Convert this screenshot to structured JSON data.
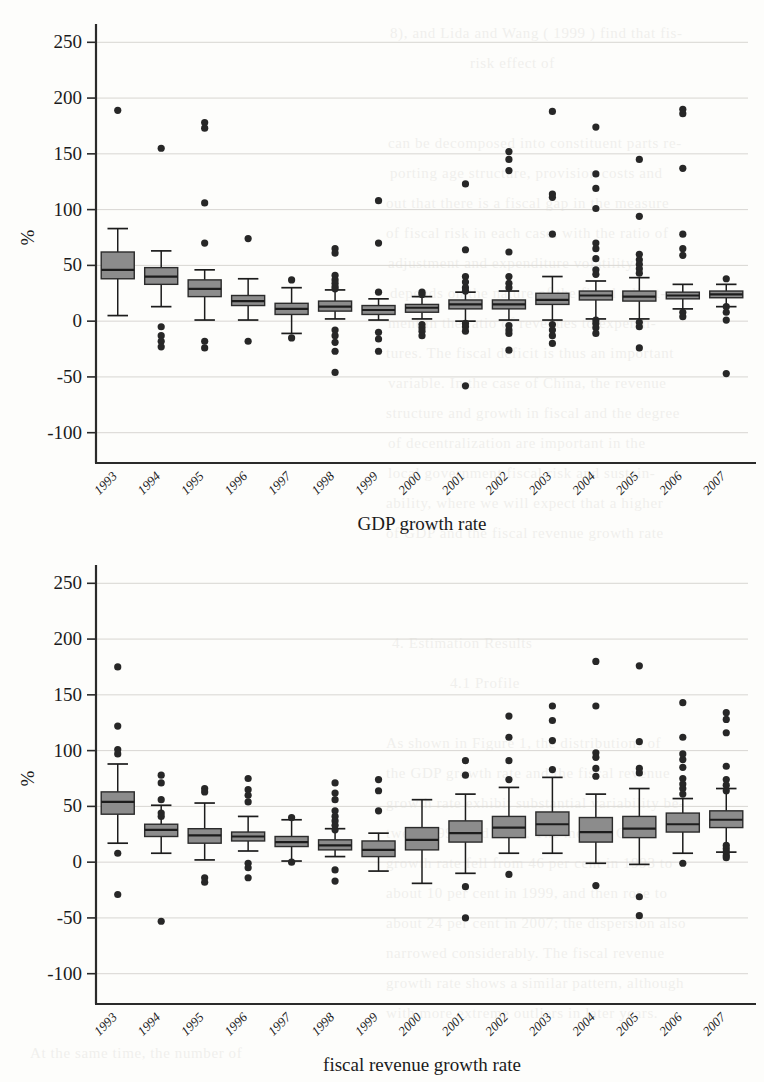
{
  "page": {
    "background_color": "#fdfdfb",
    "ink_color": "#1b1b1b",
    "box_fill_color": "#8c8c8c",
    "gridline_color": "#d8d6d2"
  },
  "bleed_through_text": [
    {
      "text": "8), and  Lida  and  Wang ( 1999 ) find  that  fis-",
      "x": 390,
      "y": 18
    },
    {
      "text": "risk  effect  of",
      "x": 470,
      "y": 48
    },
    {
      "text": "can  be  decomposed  into  constituent  parts  re-",
      "x": 388,
      "y": 128
    },
    {
      "text": "porting  age  structure,  provision  costs  and",
      "x": 390,
      "y": 158
    },
    {
      "text": "out  that  there  is  a  fiscal  gap  in  the  measure",
      "x": 386,
      "y": 188
    },
    {
      "text": "of  fiscal  risk  in  each  case,  with  the  ratio  of",
      "x": 386,
      "y": 218
    },
    {
      "text": "adjustment  and  expenditure  volatility",
      "x": 388,
      "y": 248
    },
    {
      "text": "depends  on  the  nature  of  the  fiscal  adjust-",
      "x": 390,
      "y": 278
    },
    {
      "text": "ment  in  the  ratio  of  revenues  to  expendi-",
      "x": 388,
      "y": 308
    },
    {
      "text": "tures.  The  fiscal  deficit  is  thus  an  important",
      "x": 386,
      "y": 338
    },
    {
      "text": "variable.  In  the  case  of  China,  the  revenue",
      "x": 388,
      "y": 368
    },
    {
      "text": "structure  and  growth  in  fiscal  and  the  degree",
      "x": 386,
      "y": 398
    },
    {
      "text": "of  decentralization  are  important  in  the",
      "x": 388,
      "y": 428
    },
    {
      "text": "local  government  fiscal  risk  and  sustain-",
      "x": 388,
      "y": 458
    },
    {
      "text": "ability,  where  we  will  expect  that  a  higher",
      "x": 386,
      "y": 488
    },
    {
      "text": "of  GDP  and  the  fiscal  revenue  growth  rate",
      "x": 386,
      "y": 518
    },
    {
      "text": "4. Estimation  Results",
      "x": 392,
      "y": 628
    },
    {
      "text": "4.1  Profile",
      "x": 450,
      "y": 668
    },
    {
      "text": "As  shown  in  Figure  1,  the  distributions  of",
      "x": 386,
      "y": 728
    },
    {
      "text": "the  GDP  growth  rate  and  the  fiscal  revenue",
      "x": 386,
      "y": 758
    },
    {
      "text": "growth  rate  exhibit  substantial  variability  be-",
      "x": 386,
      "y": 788
    },
    {
      "text": "tween  1993  and  2007.  The  median  GDP",
      "x": 386,
      "y": 818
    },
    {
      "text": "growth  rate  fell  from  46  per  cent  in  1993  to",
      "x": 386,
      "y": 848
    },
    {
      "text": "about  10  per  cent  in  1999,  and  then  rose  to",
      "x": 386,
      "y": 878
    },
    {
      "text": "about  24  per  cent  in  2007;  the  dispersion  also",
      "x": 386,
      "y": 908
    },
    {
      "text": "narrowed  considerably.  The  fiscal  revenue",
      "x": 386,
      "y": 938
    },
    {
      "text": "growth  rate  shows  a  similar  pattern,  although",
      "x": 386,
      "y": 968
    },
    {
      "text": "with  more  extreme  outliers  in  later  years.",
      "x": 386,
      "y": 998
    },
    {
      "text": "At  the  same  time,  the  number  of",
      "x": 30,
      "y": 1038
    }
  ],
  "chart_data": [
    {
      "id": "gdp-growth",
      "type": "box",
      "title": "GDP growth rate",
      "xlabel": "GDP growth rate",
      "ylabel": "%",
      "ylim": [
        -120,
        270
      ],
      "yticks": [
        250,
        200,
        150,
        100,
        50,
        0,
        -50,
        -100
      ],
      "ytick_labels": [
        "250",
        "200",
        "150",
        "100",
        "50",
        "0",
        "-50",
        "-100"
      ],
      "grid": "horizontal",
      "categories": [
        "1993",
        "1994",
        "1995",
        "1996",
        "1997",
        "1998",
        "1999",
        "2000",
        "2001",
        "2002",
        "2003",
        "2004",
        "2005",
        "2006",
        "2007"
      ],
      "boxes": [
        {
          "category": "1993",
          "lower_whisker": 5,
          "q1": 38,
          "median": 46,
          "q3": 62,
          "upper_whisker": 83,
          "outliers": [
            189
          ]
        },
        {
          "category": "1994",
          "lower_whisker": 13,
          "q1": 33,
          "median": 40,
          "q3": 48,
          "upper_whisker": 63,
          "outliers": [
            155,
            -5,
            -13,
            -18,
            -23
          ]
        },
        {
          "category": "1995",
          "lower_whisker": 1,
          "q1": 22,
          "median": 29,
          "q3": 37,
          "upper_whisker": 46,
          "outliers": [
            178,
            173,
            106,
            70,
            -18,
            -24
          ]
        },
        {
          "category": "1996",
          "lower_whisker": 1,
          "q1": 14,
          "median": 18,
          "q3": 23,
          "upper_whisker": 38,
          "outliers": [
            74,
            -18
          ]
        },
        {
          "category": "1997",
          "lower_whisker": -11,
          "q1": 6,
          "median": 11,
          "q3": 16,
          "upper_whisker": 30,
          "outliers": [
            37,
            -15
          ]
        },
        {
          "category": "1998",
          "lower_whisker": 2,
          "q1": 9,
          "median": 13,
          "q3": 18,
          "upper_whisker": 28,
          "outliers": [
            65,
            61,
            41,
            37,
            34,
            31,
            29,
            -8,
            -13,
            -19,
            -27,
            -46
          ]
        },
        {
          "category": "1999",
          "lower_whisker": 1,
          "q1": 6,
          "median": 10,
          "q3": 14,
          "upper_whisker": 20,
          "outliers": [
            108,
            70,
            26,
            -10,
            -16,
            -27
          ]
        },
        {
          "category": "2000",
          "lower_whisker": 2,
          "q1": 8,
          "median": 12,
          "q3": 15,
          "upper_whisker": 22,
          "outliers": [
            26,
            24,
            -3,
            -6,
            -9,
            -13
          ]
        },
        {
          "category": "2001",
          "lower_whisker": 0,
          "q1": 11,
          "median": 15,
          "q3": 19,
          "upper_whisker": 26,
          "outliers": [
            123,
            64,
            40,
            35,
            30,
            27,
            -2,
            -5,
            -9,
            -58
          ]
        },
        {
          "category": "2002",
          "lower_whisker": 1,
          "q1": 11,
          "median": 15,
          "q3": 19,
          "upper_whisker": 27,
          "outliers": [
            152,
            145,
            135,
            62,
            40,
            34,
            30,
            -4,
            -8,
            -11,
            -26
          ]
        },
        {
          "category": "2003",
          "lower_whisker": 1,
          "q1": 15,
          "median": 19,
          "q3": 25,
          "upper_whisker": 40,
          "outliers": [
            188,
            114,
            111,
            78,
            -3,
            -8,
            -13,
            -20
          ]
        },
        {
          "category": "2004",
          "lower_whisker": 2,
          "q1": 19,
          "median": 23,
          "q3": 27,
          "upper_whisker": 36,
          "outliers": [
            174,
            132,
            119,
            101,
            70,
            65,
            56,
            46,
            42,
            1,
            -2,
            -6,
            -11
          ]
        },
        {
          "category": "2005",
          "lower_whisker": 2,
          "q1": 18,
          "median": 22,
          "q3": 27,
          "upper_whisker": 39,
          "outliers": [
            145,
            94,
            60,
            55,
            51,
            47,
            43,
            -1,
            -5,
            -24
          ]
        },
        {
          "category": "2006",
          "lower_whisker": 11,
          "q1": 20,
          "median": 23,
          "q3": 26,
          "upper_whisker": 33,
          "outliers": [
            190,
            186,
            137,
            78,
            65,
            59,
            8,
            4
          ]
        },
        {
          "category": "2007",
          "lower_whisker": 13,
          "q1": 21,
          "median": 24,
          "q3": 27,
          "upper_whisker": 33,
          "outliers": [
            38,
            13,
            8,
            1,
            -47
          ]
        }
      ]
    },
    {
      "id": "fiscal-revenue-growth",
      "type": "box",
      "title": "fiscal revenue growth rate",
      "xlabel": "fiscal revenue growth rate",
      "ylabel": "%",
      "ylim": [
        -120,
        270
      ],
      "yticks": [
        250,
        200,
        150,
        100,
        50,
        0,
        -50,
        -100
      ],
      "ytick_labels": [
        "250",
        "200",
        "150",
        "100",
        "50",
        "0",
        "-50",
        "-100"
      ],
      "grid": "horizontal",
      "categories": [
        "1993",
        "1994",
        "1995",
        "1996",
        "1997",
        "1998",
        "1999",
        "2000",
        "2001",
        "2002",
        "2003",
        "2004",
        "2005",
        "2006",
        "2007"
      ],
      "boxes": [
        {
          "category": "1993",
          "lower_whisker": 17,
          "q1": 43,
          "median": 54,
          "q3": 63,
          "upper_whisker": 88,
          "outliers": [
            175,
            122,
            101,
            97,
            8,
            -29
          ]
        },
        {
          "category": "1994",
          "lower_whisker": 8,
          "q1": 23,
          "median": 29,
          "q3": 34,
          "upper_whisker": 51,
          "outliers": [
            78,
            71,
            56,
            44,
            41,
            -53
          ]
        },
        {
          "category": "1995",
          "lower_whisker": 2,
          "q1": 17,
          "median": 24,
          "q3": 30,
          "upper_whisker": 53,
          "outliers": [
            66,
            63,
            -14,
            -18
          ]
        },
        {
          "category": "1996",
          "lower_whisker": 10,
          "q1": 19,
          "median": 23,
          "q3": 27,
          "upper_whisker": 41,
          "outliers": [
            75,
            65,
            60,
            54,
            -1,
            -5,
            -14
          ]
        },
        {
          "category": "1997",
          "lower_whisker": 1,
          "q1": 14,
          "median": 18,
          "q3": 23,
          "upper_whisker": 38,
          "outliers": [
            40,
            0
          ]
        },
        {
          "category": "1998",
          "lower_whisker": 5,
          "q1": 11,
          "median": 15,
          "q3": 20,
          "upper_whisker": 30,
          "outliers": [
            71,
            62,
            56,
            46,
            41,
            37,
            33,
            29,
            -7,
            -17
          ]
        },
        {
          "category": "1999",
          "lower_whisker": -8,
          "q1": 5,
          "median": 11,
          "q3": 19,
          "upper_whisker": 26,
          "outliers": [
            74,
            64,
            46
          ]
        },
        {
          "category": "2000",
          "lower_whisker": -19,
          "q1": 11,
          "median": 20,
          "q3": 31,
          "upper_whisker": 56,
          "outliers": []
        },
        {
          "category": "2001",
          "lower_whisker": -10,
          "q1": 18,
          "median": 26,
          "q3": 37,
          "upper_whisker": 61,
          "outliers": [
            91,
            78,
            -22,
            -50
          ]
        },
        {
          "category": "2002",
          "lower_whisker": 8,
          "q1": 22,
          "median": 31,
          "q3": 41,
          "upper_whisker": 67,
          "outliers": [
            131,
            112,
            91,
            74,
            -11
          ]
        },
        {
          "category": "2003",
          "lower_whisker": 8,
          "q1": 24,
          "median": 34,
          "q3": 45,
          "upper_whisker": 76,
          "outliers": [
            140,
            127,
            109,
            83
          ]
        },
        {
          "category": "2004",
          "lower_whisker": -1,
          "q1": 18,
          "median": 27,
          "q3": 40,
          "upper_whisker": 61,
          "outliers": [
            180,
            140,
            98,
            94,
            84,
            77,
            -21
          ]
        },
        {
          "category": "2005",
          "lower_whisker": -2,
          "q1": 22,
          "median": 30,
          "q3": 41,
          "upper_whisker": 66,
          "outliers": [
            176,
            108,
            84,
            80,
            -31,
            -48
          ]
        },
        {
          "category": "2006",
          "lower_whisker": 8,
          "q1": 27,
          "median": 34,
          "q3": 44,
          "upper_whisker": 57,
          "outliers": [
            143,
            112,
            97,
            92,
            85,
            75,
            70,
            66,
            61,
            -1
          ]
        },
        {
          "category": "2007",
          "lower_whisker": 9,
          "q1": 31,
          "median": 38,
          "q3": 46,
          "upper_whisker": 66,
          "outliers": [
            134,
            128,
            116,
            86,
            74,
            69,
            64,
            15,
            12,
            9,
            6,
            4
          ]
        }
      ]
    }
  ]
}
